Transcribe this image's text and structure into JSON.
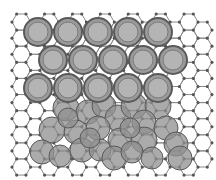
{
  "figure": {
    "colors": {
      "background": "#ffffff",
      "bond": "#8a8a8a",
      "node": "#555555",
      "atom_fill": "#9a9a9a",
      "atom_core": "#b4b4b4",
      "atom_ring": "#5a5a5a",
      "cluster_fill": "#8f8f8f"
    },
    "lattice": {
      "origin_x": 12,
      "origin_y": 14,
      "cols": 14,
      "rows": 10,
      "side": 9.3
    },
    "ordered_atoms": [
      {
        "x": 38,
        "y": 32
      },
      {
        "x": 68,
        "y": 32
      },
      {
        "x": 98,
        "y": 32
      },
      {
        "x": 128,
        "y": 32
      },
      {
        "x": 158,
        "y": 32
      },
      {
        "x": 53,
        "y": 60
      },
      {
        "x": 83,
        "y": 60
      },
      {
        "x": 113,
        "y": 60
      },
      {
        "x": 143,
        "y": 60
      },
      {
        "x": 173,
        "y": 60
      },
      {
        "x": 38,
        "y": 88
      },
      {
        "x": 68,
        "y": 88
      },
      {
        "x": 98,
        "y": 88
      },
      {
        "x": 128,
        "y": 88
      },
      {
        "x": 158,
        "y": 88
      }
    ],
    "ordered_radius": 14,
    "cluster_atoms": [
      {
        "x": 66,
        "y": 108,
        "r": 13
      },
      {
        "x": 88,
        "y": 112,
        "r": 12
      },
      {
        "x": 104,
        "y": 106,
        "r": 12
      },
      {
        "x": 118,
        "y": 118,
        "r": 13
      },
      {
        "x": 134,
        "y": 106,
        "r": 13
      },
      {
        "x": 158,
        "y": 106,
        "r": 13
      },
      {
        "x": 144,
        "y": 122,
        "r": 12
      },
      {
        "x": 52,
        "y": 130,
        "r": 13
      },
      {
        "x": 76,
        "y": 132,
        "r": 12
      },
      {
        "x": 98,
        "y": 128,
        "r": 12
      },
      {
        "x": 120,
        "y": 140,
        "r": 12
      },
      {
        "x": 144,
        "y": 140,
        "r": 13
      },
      {
        "x": 166,
        "y": 128,
        "r": 12
      },
      {
        "x": 176,
        "y": 144,
        "r": 12
      },
      {
        "x": 42,
        "y": 152,
        "r": 12
      },
      {
        "x": 60,
        "y": 156,
        "r": 11
      },
      {
        "x": 82,
        "y": 150,
        "r": 12
      },
      {
        "x": 100,
        "y": 150,
        "r": 11
      },
      {
        "x": 114,
        "y": 158,
        "r": 12
      },
      {
        "x": 132,
        "y": 152,
        "r": 11
      },
      {
        "x": 152,
        "y": 158,
        "r": 11
      },
      {
        "x": 180,
        "y": 158,
        "r": 12
      },
      {
        "x": 68,
        "y": 118,
        "r": 10
      },
      {
        "x": 130,
        "y": 128,
        "r": 10
      },
      {
        "x": 90,
        "y": 138,
        "r": 10
      }
    ]
  }
}
